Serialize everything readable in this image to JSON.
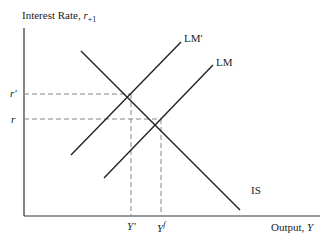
{
  "diagram": {
    "type": "IS-LM",
    "y_axis_label": "Interest Rate, ",
    "y_axis_var": "r",
    "y_axis_sub": "+1",
    "x_axis_label": "Output, ",
    "x_axis_var": "Y",
    "curves": [
      {
        "name": "IS",
        "label": "IS",
        "slope": "downward"
      },
      {
        "name": "LM",
        "label": "LM",
        "slope": "upward"
      },
      {
        "name": "LM'",
        "label": "LM'",
        "slope": "upward",
        "note": "shifted left/up"
      }
    ],
    "y_ticks": [
      {
        "label": "r'",
        "level": "higher"
      },
      {
        "label": "r",
        "level": "lower"
      }
    ],
    "x_ticks": [
      {
        "label": "Y'",
        "base": "Y",
        "mark": "'"
      },
      {
        "label": "Y^f",
        "base": "Y",
        "mark": "f"
      }
    ],
    "equilibria": [
      {
        "curves": [
          "IS",
          "LM'"
        ],
        "rate": "r'",
        "output": "Y'"
      },
      {
        "curves": [
          "IS",
          "LM"
        ],
        "rate": "r",
        "output": "Y^f"
      }
    ],
    "colors": {
      "line": "#222222",
      "dash": "#888888"
    }
  }
}
